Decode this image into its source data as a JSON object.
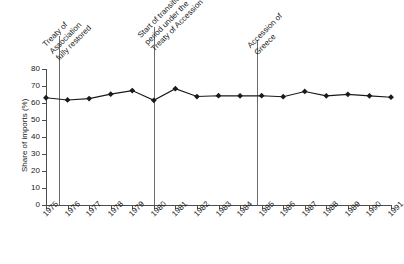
{
  "chart_data": {
    "type": "line",
    "title": "",
    "xlabel": "",
    "ylabel": "Share of imports (%)",
    "ylim": [
      0,
      80
    ],
    "ytick_step": 10,
    "yticks": [
      "0",
      "10",
      "20",
      "30",
      "40",
      "50",
      "60",
      "70",
      "80"
    ],
    "grid": false,
    "legend": "none",
    "marker": "diamond",
    "line_color": "#1a1a1a",
    "categories": [
      "1975",
      "1976",
      "1977",
      "1978",
      "1979",
      "1980",
      "1981",
      "1982",
      "1983",
      "1984",
      "1985",
      "1986",
      "1987",
      "1988",
      "1989",
      "1990",
      "1991"
    ],
    "x": [
      1975,
      1976,
      1977,
      1978,
      1979,
      1980,
      1981,
      1982,
      1983,
      1984,
      1985,
      1986,
      1987,
      1988,
      1989,
      1990,
      1991
    ],
    "values": [
      63.1,
      61.8,
      62.6,
      65.2,
      67.3,
      61.6,
      68.4,
      63.8,
      64.3,
      64.2,
      64.3,
      63.7,
      66.8,
      64.2,
      65.1,
      64.2,
      63.4
    ],
    "series": [
      {
        "name": "Share of imports (%)",
        "values": [
          63.1,
          61.8,
          62.6,
          65.2,
          67.3,
          61.6,
          68.4,
          63.8,
          64.3,
          64.2,
          64.3,
          63.7,
          66.8,
          64.2,
          65.1,
          64.2,
          63.4
        ]
      }
    ],
    "annotations": [
      {
        "id": "treaty-association",
        "x": 1975.6,
        "text": "Treaty of\nAssociation\nfully restored",
        "lines": [
          "Treaty of",
          "Association",
          "fully restored"
        ]
      },
      {
        "id": "start-transition",
        "x": 1980.0,
        "text": "Start of transition\nperiod under the\nTreaty of Accession",
        "lines": [
          "Start of transition",
          "period under the",
          "Treaty of Accession"
        ]
      },
      {
        "id": "accession-greece",
        "x": 1984.8,
        "text": "Accession of\nGreece",
        "lines": [
          "Accession of",
          "Greece"
        ]
      }
    ]
  }
}
